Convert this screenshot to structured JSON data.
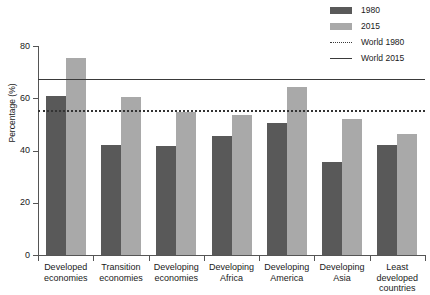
{
  "chart_data": {
    "type": "bar",
    "title": "",
    "xlabel": "",
    "ylabel": "Percentage (%)",
    "ylim": [
      0,
      80
    ],
    "yticks": [
      0,
      20,
      40,
      60,
      80
    ],
    "grid": false,
    "legend_position": "top-right",
    "categories": [
      "Developed economies",
      "Transition economies",
      "Developing economies",
      "Developing Africa",
      "Developing America",
      "Developing Asia",
      "Least developed countries"
    ],
    "category_lines": [
      [
        "Developed",
        "economies"
      ],
      [
        "Transition",
        "economies"
      ],
      [
        "Developing",
        "economies"
      ],
      [
        "Developing",
        "Africa"
      ],
      [
        "Developing",
        "America"
      ],
      [
        "Developing",
        "Asia"
      ],
      [
        "Least",
        "developed",
        "countries"
      ]
    ],
    "series": [
      {
        "name": "1980",
        "color": "#595959",
        "values": [
          61.0,
          42.0,
          41.8,
          45.5,
          50.7,
          35.6,
          42.0
        ]
      },
      {
        "name": "2015",
        "color": "#a9a9a9",
        "values": [
          75.3,
          60.5,
          54.6,
          53.6,
          64.2,
          52.0,
          46.4
        ]
      }
    ],
    "reference_lines": [
      {
        "name": "World 1980",
        "value": 55.5,
        "style": "dotted",
        "color": "#333333"
      },
      {
        "name": "World 2015",
        "value": 67.4,
        "style": "solid",
        "color": "#3a3a3a"
      }
    ]
  },
  "legend": {
    "items": [
      {
        "label": "1980",
        "swatch": "bar-dark"
      },
      {
        "label": "2015",
        "swatch": "bar-light"
      },
      {
        "label": "World 1980",
        "swatch": "dotted-line"
      },
      {
        "label": "World 2015",
        "swatch": "solid-line"
      }
    ]
  },
  "axis": {
    "y_title": "Percentage (%)",
    "y_ticks": [
      "80",
      "60",
      "40",
      "20",
      "0"
    ]
  }
}
